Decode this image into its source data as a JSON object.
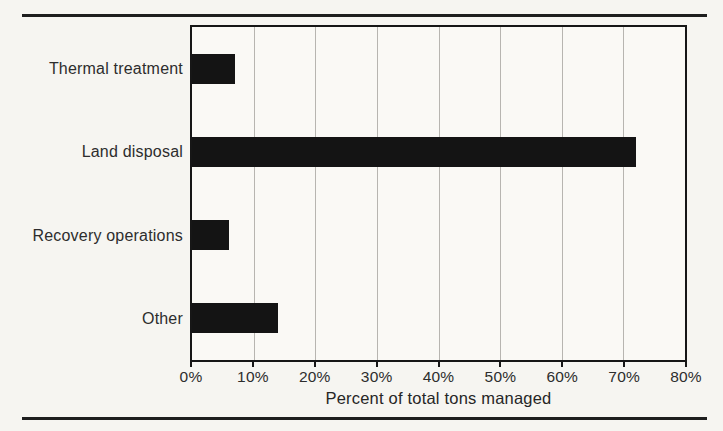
{
  "chart_data": {
    "type": "bar",
    "orientation": "horizontal",
    "title": "",
    "categories": [
      "Thermal treatment",
      "Land disposal",
      "Recovery operations",
      "Other"
    ],
    "values": [
      7,
      72,
      6,
      14
    ],
    "xlabel": "Percent of total tons managed",
    "ylabel": "",
    "xlim": [
      0,
      80
    ],
    "xtick_labels": [
      "0%",
      "10%",
      "20%",
      "30%",
      "40%",
      "50%",
      "60%",
      "70%",
      "80%"
    ],
    "grid": "vertical-gridlines-on",
    "legend": "none",
    "bar_color": "#141414"
  },
  "decorations": {
    "top_rule": true,
    "bottom_rule": true,
    "rule_color": "#1e1e1e"
  },
  "colors": {
    "background": "#f6f5f1",
    "plot_background": "#faf9f5",
    "gridline": "#b7b5b0",
    "border": "#161616",
    "text": "#2d2d2d"
  }
}
